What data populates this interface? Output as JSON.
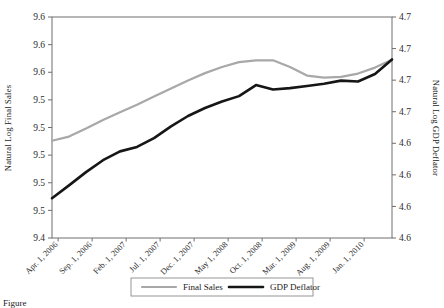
{
  "figure": {
    "caption_prefix": "Figure"
  },
  "chart_data": {
    "type": "line",
    "title": "",
    "xlabel": "",
    "ylabel": "Natural Log Final Sales",
    "y2label": "Natural Log GDP Deflator",
    "grid": false,
    "legend_position": "bottom-center",
    "categories": [
      "Apr. 1, 2006",
      "Sep. 1, 2006",
      "Feb. 1, 2007",
      "Jul. 1, 2007",
      "Dec. 1, 2007",
      "May 1, 2008",
      "Oct. 1, 2008",
      "Mar. 1, 2009",
      "Aug. 1, 2009",
      "Jan. 1, 2010"
    ],
    "ytick_labels": [
      "9.6",
      "9.6",
      "9.6",
      "9.5",
      "9.5",
      "9.5",
      "9.5",
      "9.5",
      "9.4"
    ],
    "y2tick_labels": [
      "4.7",
      "4.7",
      "4.7",
      "4.7",
      "4.6",
      "4.6",
      "4.6",
      "4.6"
    ],
    "ylim": [
      9.4,
      9.6
    ],
    "y2lim": [
      4.6,
      4.7
    ],
    "series": [
      {
        "name": "Final Sales",
        "color": "#a8a8a8",
        "axis": "left",
        "x": [
          0,
          1,
          2,
          3,
          4,
          5,
          6,
          7,
          8,
          9,
          10,
          11,
          12,
          13,
          14,
          15,
          16,
          17,
          18,
          19,
          20
        ],
        "values": [
          9.488,
          9.4918,
          9.499,
          9.5068,
          9.5138,
          9.5205,
          9.528,
          9.5352,
          9.5425,
          9.5492,
          9.5548,
          9.5592,
          9.5608,
          9.5608,
          9.5548,
          9.547,
          9.5452,
          9.5458,
          9.5488,
          9.5542,
          9.5612
        ]
      },
      {
        "name": "GDP Deflator",
        "color": "#161616",
        "axis": "right",
        "x": [
          0,
          1,
          2,
          3,
          4,
          5,
          6,
          7,
          8,
          9,
          10,
          11,
          12,
          13,
          14,
          15,
          16,
          17,
          18,
          19,
          20
        ],
        "values": [
          4.618,
          4.6238,
          4.6298,
          4.6352,
          4.6392,
          4.6412,
          4.6452,
          4.6505,
          4.6552,
          4.6588,
          4.6618,
          4.6642,
          4.6692,
          4.6672,
          4.6678,
          4.6688,
          4.6698,
          4.6712,
          4.6708,
          4.6742,
          4.6808
        ]
      }
    ]
  },
  "legend": {
    "items": [
      {
        "label": "Final Sales",
        "color": "#a8a8a8"
      },
      {
        "label": "GDP Deflator",
        "color": "#161616"
      }
    ]
  }
}
